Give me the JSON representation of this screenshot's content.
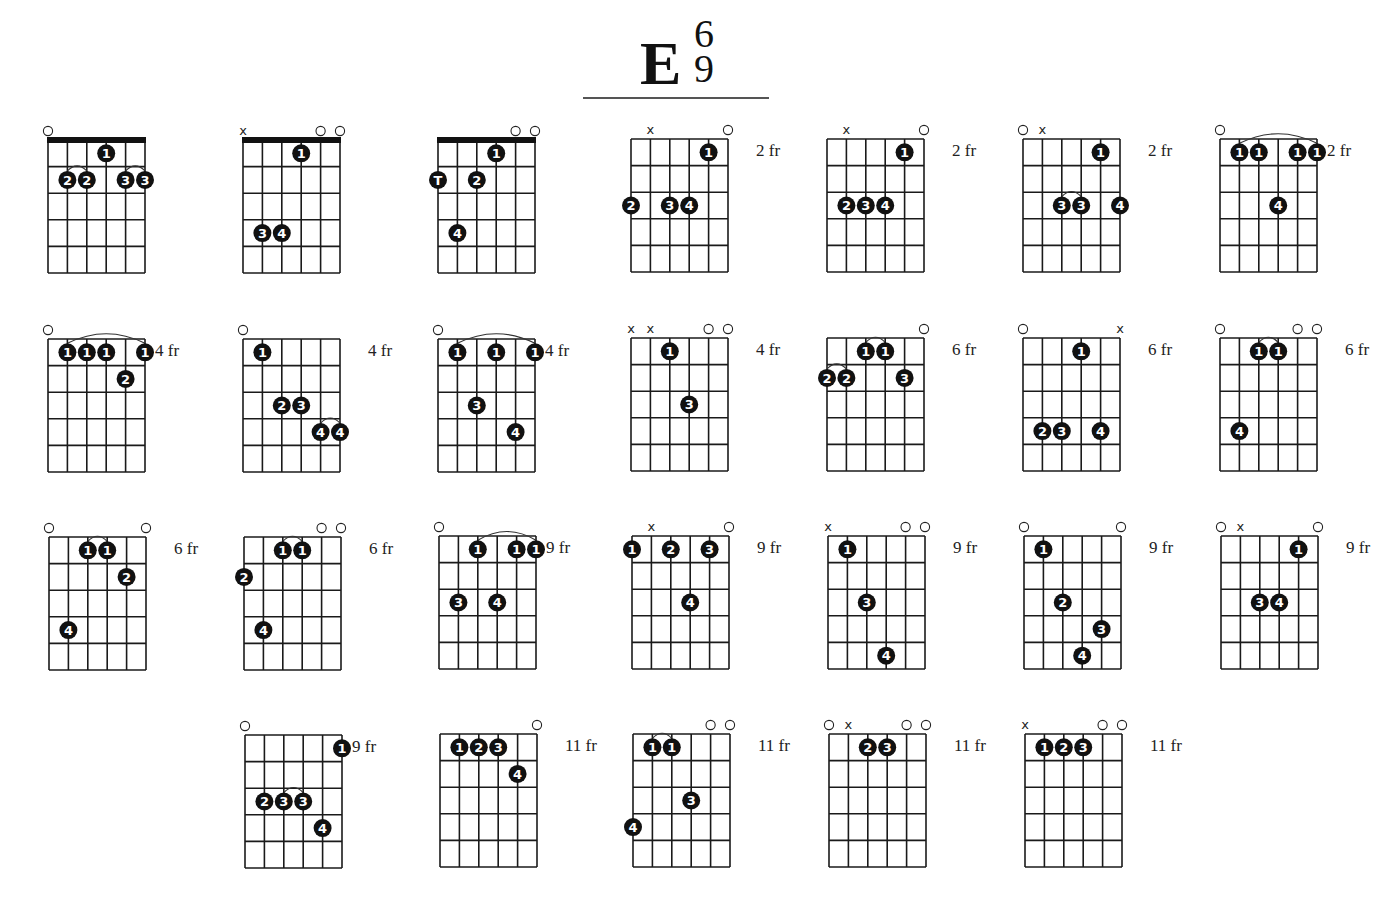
{
  "title": {
    "root": "E",
    "ext_top": "6",
    "ext_bottom": "9"
  },
  "layout": {
    "grid_width": 97,
    "grid_height": 133,
    "strings": 6,
    "frets": 5
  },
  "colors": {
    "line": "#1a1a1a",
    "dot": "#111111",
    "dot_text": "#ffffff",
    "nut": "#111111"
  },
  "diagrams": [
    {
      "x": 48,
      "y": 140,
      "nut": true,
      "fret_label": "",
      "markers": [
        "o",
        "",
        "",
        "",
        "",
        ""
      ],
      "dots": [
        [
          3,
          1,
          "1"
        ],
        [
          1,
          2,
          "2"
        ],
        [
          2,
          2,
          "2"
        ],
        [
          4,
          2,
          "3"
        ],
        [
          5,
          2,
          "3"
        ]
      ],
      "ties": [
        [
          1,
          2,
          2
        ],
        [
          4,
          5,
          2
        ]
      ]
    },
    {
      "x": 243,
      "y": 140,
      "nut": true,
      "fret_label": "",
      "markers": [
        "x",
        "",
        "",
        "",
        "o",
        "o"
      ],
      "dots": [
        [
          3,
          1,
          "1"
        ],
        [
          1,
          4,
          "3"
        ],
        [
          2,
          4,
          "4"
        ]
      ],
      "ties": []
    },
    {
      "x": 438,
      "y": 140,
      "nut": true,
      "fret_label": "",
      "markers": [
        "",
        "",
        "",
        "",
        "o",
        "o"
      ],
      "dots": [
        [
          3,
          1,
          "1"
        ],
        [
          0,
          2,
          "T"
        ],
        [
          2,
          2,
          "2"
        ],
        [
          1,
          4,
          "4"
        ]
      ],
      "ties": []
    },
    {
      "x": 631,
      "y": 139,
      "nut": false,
      "fret_label": "2 fr",
      "markers": [
        "",
        "x",
        "",
        "",
        "",
        "o"
      ],
      "dots": [
        [
          4,
          1,
          "1"
        ],
        [
          0,
          3,
          "2"
        ],
        [
          2,
          3,
          "3"
        ],
        [
          3,
          3,
          "4"
        ]
      ],
      "ties": []
    },
    {
      "x": 827,
      "y": 139,
      "nut": false,
      "fret_label": "2 fr",
      "markers": [
        "",
        "x",
        "",
        "",
        "",
        "o"
      ],
      "dots": [
        [
          4,
          1,
          "1"
        ],
        [
          1,
          3,
          "2"
        ],
        [
          2,
          3,
          "3"
        ],
        [
          3,
          3,
          "4"
        ]
      ],
      "ties": []
    },
    {
      "x": 1023,
      "y": 139,
      "nut": false,
      "fret_label": "2 fr",
      "markers": [
        "o",
        "x",
        "",
        "",
        "",
        ""
      ],
      "dots": [
        [
          4,
          1,
          "1"
        ],
        [
          2,
          3,
          "3"
        ],
        [
          3,
          3,
          "3"
        ],
        [
          5,
          3,
          "4"
        ]
      ],
      "ties": [
        [
          2,
          3,
          3
        ]
      ]
    },
    {
      "x": 1220,
      "y": 139,
      "nut": false,
      "fret_label": "2 fr",
      "markers": [
        "o",
        "",
        "",
        "",
        "",
        ""
      ],
      "dots": [
        [
          1,
          1,
          "1"
        ],
        [
          2,
          1,
          "1"
        ],
        [
          4,
          1,
          "1"
        ],
        [
          5,
          1,
          "1"
        ],
        [
          3,
          3,
          "4"
        ]
      ],
      "ties": [
        [
          1,
          5,
          1
        ]
      ]
    },
    {
      "x": 48,
      "y": 339,
      "nut": false,
      "fret_label": "4 fr",
      "markers": [
        "o",
        "",
        "",
        "",
        "",
        ""
      ],
      "dots": [
        [
          1,
          1,
          "1"
        ],
        [
          2,
          1,
          "1"
        ],
        [
          3,
          1,
          "1"
        ],
        [
          5,
          1,
          "1"
        ],
        [
          4,
          2,
          "2"
        ]
      ],
      "ties": [
        [
          1,
          5,
          1
        ]
      ]
    },
    {
      "x": 243,
      "y": 339,
      "nut": false,
      "fret_label": "4 fr",
      "markers": [
        "o",
        "",
        "",
        "",
        "",
        ""
      ],
      "dots": [
        [
          1,
          1,
          "1"
        ],
        [
          2,
          3,
          "2"
        ],
        [
          3,
          3,
          "3"
        ],
        [
          4,
          4,
          "4"
        ],
        [
          5,
          4,
          "4"
        ]
      ],
      "ties": [
        [
          4,
          5,
          4
        ]
      ]
    },
    {
      "x": 438,
      "y": 339,
      "nut": false,
      "fret_label": "4 fr",
      "markers": [
        "o",
        "",
        "",
        "",
        "",
        ""
      ],
      "dots": [
        [
          1,
          1,
          "1"
        ],
        [
          3,
          1,
          "1"
        ],
        [
          5,
          1,
          "1"
        ],
        [
          2,
          3,
          "3"
        ],
        [
          4,
          4,
          "4"
        ]
      ],
      "ties": [
        [
          1,
          5,
          1
        ]
      ]
    },
    {
      "x": 631,
      "y": 338,
      "nut": false,
      "fret_label": "4 fr",
      "markers": [
        "x",
        "x",
        "",
        "",
        "o",
        "o"
      ],
      "dots": [
        [
          2,
          1,
          "1"
        ],
        [
          3,
          3,
          "3"
        ]
      ],
      "ties": []
    },
    {
      "x": 827,
      "y": 338,
      "nut": false,
      "fret_label": "6 fr",
      "markers": [
        "",
        "",
        "",
        "",
        "",
        "o"
      ],
      "dots": [
        [
          2,
          1,
          "1"
        ],
        [
          3,
          1,
          "1"
        ],
        [
          0,
          2,
          "2"
        ],
        [
          1,
          2,
          "2"
        ],
        [
          4,
          2,
          "3"
        ]
      ],
      "ties": [
        [
          2,
          3,
          1
        ],
        [
          0,
          1,
          2
        ]
      ]
    },
    {
      "x": 1023,
      "y": 338,
      "nut": false,
      "fret_label": "6 fr",
      "markers": [
        "o",
        "",
        "",
        "",
        "",
        "x"
      ],
      "dots": [
        [
          3,
          1,
          "1"
        ],
        [
          1,
          4,
          "2"
        ],
        [
          2,
          4,
          "3"
        ],
        [
          4,
          4,
          "4"
        ]
      ],
      "ties": []
    },
    {
      "x": 1220,
      "y": 338,
      "nut": false,
      "fret_label": "6 fr",
      "markers": [
        "o",
        "",
        "",
        "",
        "o",
        "o"
      ],
      "dots": [
        [
          2,
          1,
          "1"
        ],
        [
          3,
          1,
          "1"
        ],
        [
          1,
          4,
          "4"
        ]
      ],
      "ties": [
        [
          2,
          3,
          1
        ]
      ]
    },
    {
      "x": 49,
      "y": 537,
      "nut": false,
      "fret_label": "6 fr",
      "markers": [
        "o",
        "",
        "",
        "",
        "",
        "o"
      ],
      "dots": [
        [
          2,
          1,
          "1"
        ],
        [
          3,
          1,
          "1"
        ],
        [
          4,
          2,
          "2"
        ],
        [
          1,
          4,
          "4"
        ]
      ],
      "ties": [
        [
          2,
          3,
          1
        ]
      ]
    },
    {
      "x": 244,
      "y": 537,
      "nut": false,
      "fret_label": "6 fr",
      "markers": [
        "",
        "",
        "",
        "",
        "o",
        "o"
      ],
      "dots": [
        [
          2,
          1,
          "1"
        ],
        [
          3,
          1,
          "1"
        ],
        [
          0,
          2,
          "2"
        ],
        [
          1,
          4,
          "4"
        ]
      ],
      "ties": [
        [
          2,
          3,
          1
        ]
      ]
    },
    {
      "x": 439,
      "y": 536,
      "nut": false,
      "fret_label": "9 fr",
      "markers": [
        "o",
        "",
        "",
        "",
        "",
        ""
      ],
      "dots": [
        [
          2,
          1,
          "1"
        ],
        [
          4,
          1,
          "1"
        ],
        [
          5,
          1,
          "1"
        ],
        [
          1,
          3,
          "3"
        ],
        [
          3,
          3,
          "4"
        ]
      ],
      "ties": [
        [
          2,
          5,
          1
        ]
      ]
    },
    {
      "x": 632,
      "y": 536,
      "nut": false,
      "fret_label": "9 fr",
      "markers": [
        "",
        "x",
        "",
        "",
        "",
        "o"
      ],
      "dots": [
        [
          0,
          1,
          "1"
        ],
        [
          2,
          1,
          "2"
        ],
        [
          4,
          1,
          "3"
        ],
        [
          3,
          3,
          "4"
        ]
      ],
      "ties": []
    },
    {
      "x": 828,
      "y": 536,
      "nut": false,
      "fret_label": "9 fr",
      "markers": [
        "x",
        "",
        "",
        "",
        "o",
        "o"
      ],
      "dots": [
        [
          1,
          1,
          "1"
        ],
        [
          2,
          3,
          "3"
        ],
        [
          3,
          5,
          "4"
        ]
      ],
      "ties": []
    },
    {
      "x": 1024,
      "y": 536,
      "nut": false,
      "fret_label": "9 fr",
      "markers": [
        "o",
        "",
        "",
        "",
        "",
        "o"
      ],
      "dots": [
        [
          1,
          1,
          "1"
        ],
        [
          2,
          3,
          "2"
        ],
        [
          4,
          4,
          "3"
        ],
        [
          3,
          5,
          "4"
        ]
      ],
      "ties": []
    },
    {
      "x": 1221,
      "y": 536,
      "nut": false,
      "fret_label": "9 fr",
      "markers": [
        "o",
        "x",
        "",
        "",
        "",
        "o"
      ],
      "dots": [
        [
          4,
          1,
          "1"
        ],
        [
          2,
          3,
          "3"
        ],
        [
          3,
          3,
          "4"
        ]
      ],
      "ties": []
    },
    {
      "x": 245,
      "y": 735,
      "nut": false,
      "fret_label": "9 fr",
      "markers": [
        "o",
        "",
        "",
        "",
        "",
        ""
      ],
      "dots": [
        [
          5,
          1,
          "1"
        ],
        [
          1,
          3,
          "2"
        ],
        [
          2,
          3,
          "3"
        ],
        [
          3,
          3,
          "3"
        ],
        [
          4,
          4,
          "4"
        ]
      ],
      "ties": [
        [
          2,
          3,
          3
        ]
      ]
    },
    {
      "x": 440,
      "y": 734,
      "nut": false,
      "fret_label": "11 fr",
      "markers": [
        "",
        "",
        "",
        "",
        "",
        "o"
      ],
      "dots": [
        [
          1,
          1,
          "1"
        ],
        [
          2,
          1,
          "2"
        ],
        [
          3,
          1,
          "3"
        ],
        [
          4,
          2,
          "4"
        ]
      ],
      "ties": []
    },
    {
      "x": 633,
      "y": 734,
      "nut": false,
      "fret_label": "11 fr",
      "markers": [
        "",
        "",
        "",
        "",
        "o",
        "o"
      ],
      "dots": [
        [
          1,
          1,
          "1"
        ],
        [
          2,
          1,
          "1"
        ],
        [
          3,
          3,
          "3"
        ],
        [
          0,
          4,
          "4"
        ]
      ],
      "ties": [
        [
          1,
          2,
          1
        ]
      ]
    },
    {
      "x": 829,
      "y": 734,
      "nut": false,
      "fret_label": "11 fr",
      "markers": [
        "o",
        "x",
        "",
        "",
        "o",
        "o"
      ],
      "dots": [
        [
          2,
          1,
          "2"
        ],
        [
          3,
          1,
          "3"
        ]
      ],
      "ties": []
    },
    {
      "x": 1025,
      "y": 734,
      "nut": false,
      "fret_label": "11 fr",
      "markers": [
        "x",
        "",
        "",
        "",
        "o",
        "o"
      ],
      "dots": [
        [
          1,
          1,
          "1"
        ],
        [
          2,
          1,
          "2"
        ],
        [
          3,
          1,
          "3"
        ]
      ],
      "ties": []
    }
  ]
}
